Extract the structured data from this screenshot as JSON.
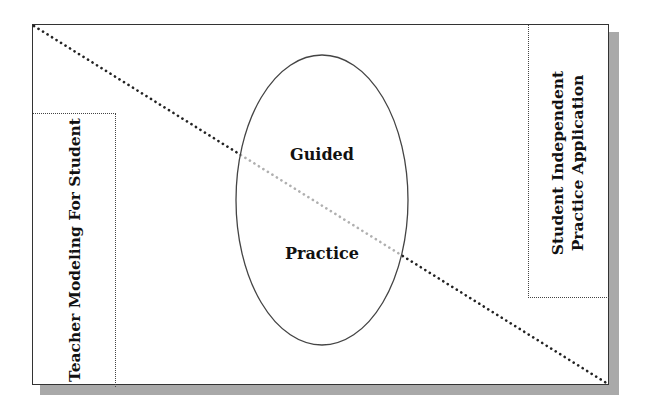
{
  "diagram": {
    "type": "gradual-release-model",
    "left_box": {
      "label": "Teacher Modeling For Student"
    },
    "right_box": {
      "label_line1": "Student Independent",
      "label_line2": "Practice Application"
    },
    "center_ellipse": {
      "label_line1": "Guided",
      "label_line2": "Practice"
    },
    "diagonal": {
      "from": "top-left",
      "to": "bottom-right",
      "style": "dotted"
    },
    "colors": {
      "frame": "#333333",
      "shadow": "#a9a9a9",
      "dots": "#222222",
      "dots_inside_ellipse": "#b0b0b0"
    }
  }
}
